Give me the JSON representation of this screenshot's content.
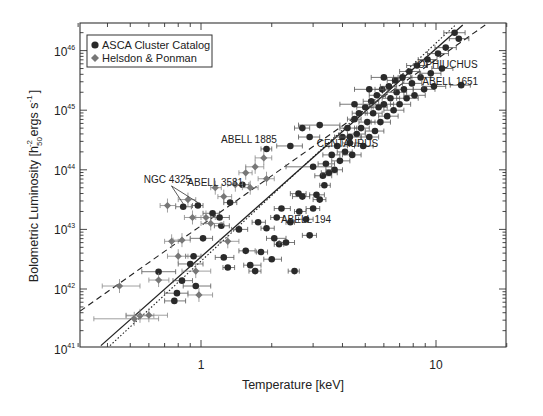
{
  "chart_data": {
    "type": "scatter",
    "title": "",
    "xlabel": "Temperature [keV]",
    "ylabel": "Bolometric Luminosity [h50^-2 ergs s^-1]",
    "ylabel_parts": {
      "main": "Bolometric Luminosity [h",
      "sub": "50",
      "sup": "-2",
      "rest": " ergs s",
      "sup2": "-1",
      "end": "]"
    },
    "xscale": "log",
    "yscale": "log",
    "xlim": [
      0.3,
      20
    ],
    "ylim": [
      1e+41,
      3e+46
    ],
    "x_ticks": [
      {
        "value": 1,
        "label": "1"
      },
      {
        "value": 10,
        "label": "10"
      }
    ],
    "y_ticks": [
      {
        "value": 41,
        "label": "10",
        "exp": "41"
      },
      {
        "value": 42,
        "label": "10",
        "exp": "42"
      },
      {
        "value": 43,
        "label": "10",
        "exp": "43"
      },
      {
        "value": 44,
        "label": "10",
        "exp": "44"
      },
      {
        "value": 45,
        "label": "10",
        "exp": "45"
      },
      {
        "value": 46,
        "label": "10",
        "exp": "46"
      }
    ],
    "grid": false,
    "legend_position": "upper left",
    "legend": [
      {
        "label": "ASCA Cluster Catalog",
        "marker": "circle",
        "color": "#2a2a2a"
      },
      {
        "label": "Helsdon & Ponman",
        "marker": "diamond",
        "color": "#777777"
      }
    ],
    "fit_lines": [
      {
        "name": "solid fit",
        "style": "solid",
        "x": [
          0.375,
          13.0
        ],
        "log10_y": [
          41.05,
          46.43
        ]
      },
      {
        "name": "dotted fit",
        "style": "dotted",
        "x": [
          0.41,
          12.1
        ],
        "log10_y": [
          41.05,
          46.43
        ]
      },
      {
        "name": "dashed fit",
        "style": "dashed",
        "x": [
          0.306,
          16.2
        ],
        "log10_y": [
          41.63,
          46.43
        ]
      }
    ],
    "annotations": [
      {
        "text": "NGC 4325",
        "x": 0.72,
        "log10_y": 43.78,
        "arrows_to": [
          [
            0.84,
            43.38
          ],
          [
            0.97,
            43.4
          ]
        ]
      },
      {
        "text": "ABELL 3581",
        "x": 1.15,
        "log10_y": 43.73
      },
      {
        "text": "ABELL 1885",
        "x": 1.6,
        "log10_y": 44.45
      },
      {
        "text": "CENTAURUS",
        "x": 4.2,
        "log10_y": 44.38
      },
      {
        "text": "ABELL 194",
        "x": 2.8,
        "log10_y": 43.1
      },
      {
        "text": "OPHIUCHUS",
        "x": 11.2,
        "log10_y": 45.7
      },
      {
        "text": "ABELL 1651",
        "x": 11.5,
        "log10_y": 45.42
      }
    ],
    "series": [
      {
        "name": "ASCA Cluster Catalog",
        "marker": "circle",
        "points": [
          [
            0.66,
            42.29,
            0.56,
            0.78
          ],
          [
            0.77,
            41.8,
            0.7,
            0.86
          ],
          [
            0.79,
            41.93,
            0.7,
            0.88
          ],
          [
            0.83,
            42.14,
            0.76,
            0.92
          ],
          [
            0.84,
            43.38,
            0.78,
            0.91
          ],
          [
            0.9,
            42.42,
            0.8,
            1.02
          ],
          [
            0.93,
            42.55,
            0.86,
            1.0
          ],
          [
            0.95,
            42.05,
            0.84,
            1.1
          ],
          [
            0.97,
            43.4,
            0.92,
            1.02
          ],
          [
            1.02,
            42.85,
            0.9,
            1.12
          ],
          [
            1.12,
            43.27,
            1.02,
            1.2
          ],
          [
            1.2,
            43.2,
            1.1,
            1.32
          ],
          [
            1.22,
            43.06,
            1.14,
            1.32
          ],
          [
            1.25,
            42.53,
            1.15,
            1.38
          ],
          [
            1.3,
            42.36,
            1.24,
            1.39
          ],
          [
            1.33,
            43.45,
            1.25,
            1.42
          ],
          [
            1.45,
            43.0,
            1.35,
            1.58
          ],
          [
            1.5,
            43.75,
            1.4,
            1.6
          ],
          [
            1.55,
            42.64,
            1.45,
            1.7
          ],
          [
            1.62,
            42.4,
            1.52,
            1.8
          ],
          [
            1.7,
            42.3,
            1.6,
            1.8
          ],
          [
            1.75,
            43.12,
            1.65,
            1.88
          ],
          [
            1.8,
            42.62,
            1.72,
            1.92
          ],
          [
            1.9,
            43.02,
            1.8,
            2.05
          ],
          [
            2.0,
            42.5,
            1.85,
            2.2
          ],
          [
            2.05,
            42.85,
            1.9,
            2.3
          ],
          [
            2.1,
            43.2,
            1.98,
            2.25
          ],
          [
            2.15,
            42.75,
            2.05,
            2.25
          ],
          [
            2.2,
            43.35,
            2.05,
            2.4
          ],
          [
            2.3,
            42.78,
            2.15,
            2.5
          ],
          [
            2.4,
            43.12,
            2.3,
            2.5
          ],
          [
            2.5,
            42.3,
            2.35,
            2.62
          ],
          [
            2.6,
            43.6,
            2.4,
            2.8
          ],
          [
            2.62,
            43.3,
            2.5,
            2.8
          ],
          [
            2.7,
            43.55,
            2.45,
            2.9
          ],
          [
            2.8,
            43.17,
            2.6,
            3.0
          ],
          [
            2.9,
            42.9,
            2.7,
            3.1
          ],
          [
            3.0,
            43.35,
            2.8,
            3.2
          ],
          [
            3.1,
            43.58,
            2.9,
            3.35
          ],
          [
            3.2,
            43.5,
            3.0,
            3.4
          ],
          [
            3.3,
            43.9,
            3.05,
            3.6
          ],
          [
            3.35,
            43.74,
            3.2,
            3.55
          ],
          [
            3.4,
            44.1,
            3.15,
            3.7
          ],
          [
            3.5,
            43.95,
            3.25,
            3.8
          ],
          [
            3.6,
            44.25,
            3.3,
            3.9
          ],
          [
            3.7,
            44.0,
            3.4,
            4.0
          ],
          [
            3.8,
            44.4,
            3.5,
            4.2
          ],
          [
            3.9,
            44.15,
            3.6,
            4.3
          ],
          [
            4.0,
            44.55,
            3.7,
            4.3
          ],
          [
            4.1,
            44.3,
            3.8,
            4.4
          ],
          [
            4.2,
            44.7,
            3.9,
            4.6
          ],
          [
            4.3,
            44.45,
            4.0,
            4.7
          ],
          [
            4.4,
            44.25,
            4.0,
            4.8
          ],
          [
            4.5,
            44.85,
            4.2,
            4.8
          ],
          [
            4.6,
            44.6,
            4.2,
            5.0
          ],
          [
            4.7,
            44.95,
            4.4,
            5.1
          ],
          [
            4.8,
            44.7,
            4.5,
            5.2
          ],
          [
            4.9,
            44.4,
            4.5,
            5.4
          ],
          [
            5.0,
            45.05,
            4.6,
            5.4
          ],
          [
            5.1,
            44.8,
            4.7,
            5.5
          ],
          [
            5.2,
            44.55,
            4.8,
            5.7
          ],
          [
            5.3,
            45.15,
            4.9,
            5.7
          ],
          [
            5.4,
            44.95,
            5.0,
            5.9
          ],
          [
            5.5,
            44.65,
            5.0,
            6.0
          ],
          [
            5.6,
            45.25,
            5.2,
            6.1
          ],
          [
            5.7,
            45.05,
            5.3,
            6.2
          ],
          [
            5.8,
            44.8,
            5.3,
            6.4
          ],
          [
            5.9,
            45.35,
            5.5,
            6.3
          ],
          [
            6.0,
            45.1,
            5.5,
            6.6
          ],
          [
            6.2,
            44.9,
            5.7,
            6.9
          ],
          [
            6.3,
            45.4,
            5.8,
            6.8
          ],
          [
            6.4,
            45.2,
            5.9,
            7.0
          ],
          [
            6.6,
            45.0,
            6.0,
            7.3
          ],
          [
            6.7,
            45.5,
            6.2,
            7.3
          ],
          [
            6.8,
            45.3,
            6.2,
            7.5
          ],
          [
            7.0,
            45.1,
            6.4,
            7.8
          ],
          [
            7.2,
            45.55,
            6.6,
            7.9
          ],
          [
            7.3,
            45.35,
            6.7,
            8.0
          ],
          [
            7.5,
            45.2,
            6.8,
            8.4
          ],
          [
            7.7,
            45.65,
            7.0,
            8.5
          ],
          [
            7.9,
            45.45,
            7.2,
            8.7
          ],
          [
            8.1,
            45.25,
            7.3,
            9.0
          ],
          [
            8.3,
            45.75,
            7.5,
            9.2
          ],
          [
            8.6,
            45.55,
            7.8,
            9.5
          ],
          [
            8.9,
            45.35,
            8.0,
            9.9
          ],
          [
            9.2,
            45.85,
            8.4,
            10.1
          ],
          [
            9.5,
            45.62,
            8.6,
            10.5
          ],
          [
            9.8,
            45.4,
            8.8,
            11.0
          ],
          [
            10.2,
            45.95,
            9.2,
            11.3
          ],
          [
            10.6,
            45.7,
            9.6,
            11.8
          ],
          [
            11.0,
            46.05,
            9.9,
            12.2
          ],
          [
            12.0,
            46.3,
            10.8,
            13.3
          ],
          [
            12.5,
            46.2,
            11.4,
            13.8
          ],
          [
            12.8,
            45.42,
            11.5,
            14.0
          ],
          [
            4.3,
            44.55,
            3.9,
            4.8
          ],
          [
            3.0,
            44.05,
            2.3,
            3.6
          ],
          [
            2.4,
            44.4,
            2.1,
            2.7
          ],
          [
            3.2,
            44.75,
            2.6,
            3.9
          ],
          [
            4.5,
            45.1,
            3.9,
            5.2
          ],
          [
            5.2,
            45.35,
            4.5,
            6.0
          ],
          [
            6.0,
            45.55,
            5.3,
            6.9
          ],
          [
            2.9,
            44.55,
            2.6,
            3.2
          ],
          [
            2.7,
            44.7,
            2.5,
            2.9
          ],
          [
            1.9,
            44.35,
            1.8,
            2.0
          ]
        ]
      },
      {
        "name": "Helsdon & Ponman",
        "marker": "diamond",
        "points": [
          [
            0.45,
            42.05,
            0.38,
            0.55
          ],
          [
            0.52,
            41.5,
            0.35,
            0.66
          ],
          [
            0.55,
            41.55,
            0.48,
            0.63
          ],
          [
            0.6,
            41.56,
            0.48,
            0.72
          ],
          [
            0.66,
            42.15,
            0.6,
            0.73
          ],
          [
            0.72,
            43.4,
            0.67,
            0.78
          ],
          [
            0.75,
            42.8,
            0.7,
            0.8
          ],
          [
            0.8,
            42.55,
            0.72,
            0.88
          ],
          [
            0.83,
            42.82,
            0.76,
            0.9
          ],
          [
            0.88,
            43.5,
            0.8,
            0.95
          ],
          [
            0.92,
            43.2,
            0.85,
            1.0
          ],
          [
            0.95,
            42.3,
            0.83,
            1.1
          ],
          [
            0.98,
            41.9,
            0.88,
            1.12
          ],
          [
            1.05,
            43.2,
            0.95,
            1.15
          ],
          [
            1.1,
            43.1,
            1.0,
            1.25
          ],
          [
            1.15,
            43.7,
            1.1,
            1.22
          ],
          [
            1.25,
            43.55,
            1.18,
            1.35
          ],
          [
            1.3,
            42.8,
            1.2,
            1.45
          ],
          [
            1.4,
            43.75,
            1.3,
            1.5
          ],
          [
            1.55,
            43.95,
            1.45,
            1.65
          ],
          [
            1.62,
            43.7,
            1.5,
            1.75
          ],
          [
            1.7,
            44.05,
            1.55,
            1.85
          ],
          [
            1.85,
            44.2,
            1.7,
            2.0
          ],
          [
            1.9,
            43.85,
            1.75,
            2.05
          ]
        ]
      }
    ]
  }
}
